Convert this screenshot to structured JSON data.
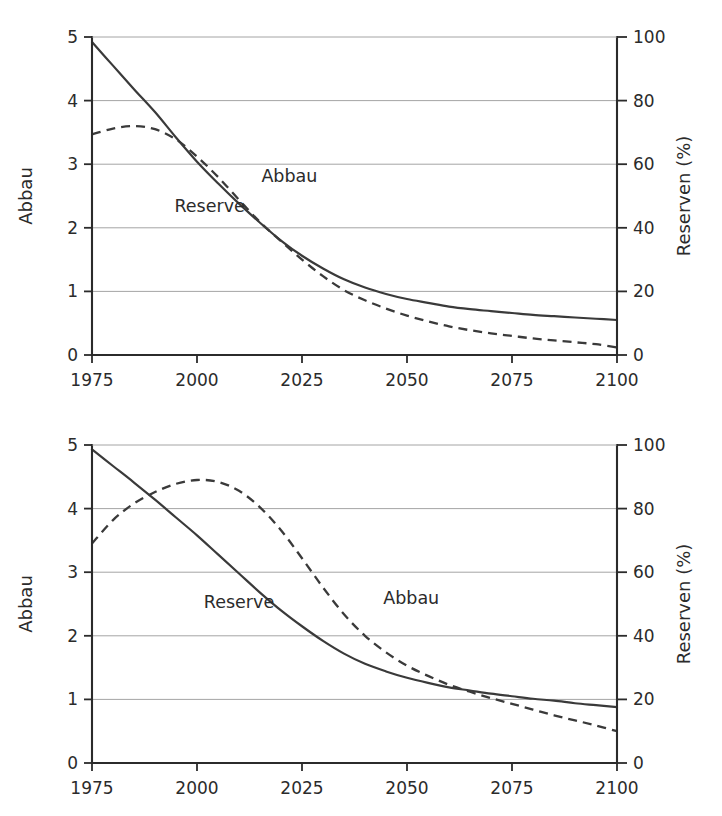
{
  "figure": {
    "background": "#ffffff",
    "ink_color": "#2b2b2b",
    "grid_color": "#9a9a9a"
  },
  "chart_data": [
    {
      "type": "line",
      "panel": "top",
      "title": "",
      "subtitle": "",
      "xlabel": "",
      "ylabel": "Abbau",
      "y2label": "Reserven (%)",
      "xlim": [
        1975,
        2100
      ],
      "ylim": [
        0,
        5
      ],
      "y2lim": [
        0,
        100
      ],
      "grid": true,
      "grid_axis": "y",
      "legend": "inline-annotations",
      "xticks": [
        1975,
        2000,
        2025,
        2050,
        2075,
        2100
      ],
      "xticklabels": [
        "1975",
        "2000",
        "2025",
        "2050",
        "2075",
        "2100"
      ],
      "yticks": [
        0,
        1,
        2,
        3,
        4,
        5
      ],
      "yticklabels": [
        "0",
        "1",
        "2",
        "3",
        "4",
        "5"
      ],
      "y2ticks": [
        0,
        20,
        40,
        60,
        80,
        100
      ],
      "y2ticklabels": [
        "0",
        "20",
        "40",
        "60",
        "80",
        "100"
      ],
      "annotations": [
        {
          "text": "Reserve",
          "x": 2003,
          "y": 2.25
        },
        {
          "text": "Abbau",
          "x": 2022,
          "y": 2.72
        }
      ],
      "x": [
        1975,
        1980,
        1985,
        1990,
        1995,
        2000,
        2005,
        2010,
        2015,
        2020,
        2025,
        2030,
        2035,
        2040,
        2045,
        2050,
        2055,
        2060,
        2065,
        2070,
        2075,
        2080,
        2085,
        2090,
        2095,
        2100
      ],
      "series": [
        {
          "name": "Reserve",
          "style": "solid",
          "axis": "left",
          "units": "Abbau / Reserven (%)",
          "values": [
            4.92,
            4.55,
            4.18,
            3.82,
            3.42,
            3.04,
            2.7,
            2.38,
            2.08,
            1.8,
            1.56,
            1.36,
            1.19,
            1.06,
            0.96,
            0.88,
            0.82,
            0.76,
            0.72,
            0.69,
            0.66,
            0.63,
            0.61,
            0.59,
            0.57,
            0.55
          ],
          "values_percent": [
            98.4,
            91.0,
            83.6,
            76.4,
            68.4,
            60.8,
            54.0,
            47.6,
            41.6,
            36.0,
            31.2,
            27.2,
            23.8,
            21.2,
            19.2,
            17.6,
            16.4,
            15.2,
            14.4,
            13.8,
            13.2,
            12.6,
            12.2,
            11.8,
            11.4,
            11.0
          ]
        },
        {
          "name": "Abbau",
          "style": "dashed",
          "axis": "left",
          "units": "Abbau / Reserven (%)",
          "values": [
            3.47,
            3.56,
            3.6,
            3.55,
            3.39,
            3.12,
            2.8,
            2.44,
            2.09,
            1.79,
            1.5,
            1.24,
            1.02,
            0.86,
            0.73,
            0.62,
            0.53,
            0.45,
            0.39,
            0.34,
            0.3,
            0.26,
            0.23,
            0.2,
            0.17,
            0.12
          ],
          "values_percent": [
            69.4,
            71.2,
            72.0,
            71.0,
            67.8,
            62.4,
            56.0,
            48.8,
            41.8,
            35.8,
            30.0,
            24.8,
            20.4,
            17.2,
            14.6,
            12.4,
            10.6,
            9.0,
            7.8,
            6.8,
            6.0,
            5.2,
            4.6,
            4.0,
            3.4,
            2.4
          ]
        }
      ]
    },
    {
      "type": "line",
      "panel": "bottom",
      "title": "",
      "subtitle": "",
      "xlabel": "",
      "ylabel": "Abbau",
      "y2label": "Reserven (%)",
      "xlim": [
        1975,
        2100
      ],
      "ylim": [
        0,
        5
      ],
      "y2lim": [
        0,
        100
      ],
      "grid": true,
      "grid_axis": "y",
      "legend": "inline-annotations",
      "xticks": [
        1975,
        2000,
        2025,
        2050,
        2075,
        2100
      ],
      "xticklabels": [
        "1975",
        "2000",
        "2025",
        "2050",
        "2075",
        "2100"
      ],
      "yticks": [
        0,
        1,
        2,
        3,
        4,
        5
      ],
      "yticklabels": [
        "0",
        "1",
        "2",
        "3",
        "4",
        "5"
      ],
      "y2ticks": [
        0,
        20,
        40,
        60,
        80,
        100
      ],
      "y2ticklabels": [
        "0",
        "20",
        "40",
        "60",
        "80",
        "100"
      ],
      "annotations": [
        {
          "text": "Reserve",
          "x": 2010,
          "y": 2.44
        },
        {
          "text": "Abbau",
          "x": 2051,
          "y": 2.5
        }
      ],
      "x": [
        1975,
        1980,
        1985,
        1990,
        1995,
        2000,
        2005,
        2010,
        2015,
        2020,
        2025,
        2030,
        2035,
        2040,
        2045,
        2050,
        2055,
        2060,
        2065,
        2070,
        2075,
        2080,
        2085,
        2090,
        2095,
        2100
      ],
      "series": [
        {
          "name": "Reserve",
          "style": "solid",
          "axis": "left",
          "units": "Abbau / Reserven (%)",
          "values": [
            4.93,
            4.67,
            4.41,
            4.14,
            3.86,
            3.58,
            3.28,
            2.98,
            2.68,
            2.4,
            2.15,
            1.92,
            1.72,
            1.56,
            1.44,
            1.34,
            1.26,
            1.19,
            1.14,
            1.09,
            1.05,
            1.01,
            0.98,
            0.94,
            0.91,
            0.88
          ],
          "values_percent": [
            98.6,
            93.4,
            88.2,
            82.8,
            77.2,
            71.6,
            65.6,
            59.6,
            53.6,
            48.0,
            43.0,
            38.4,
            34.4,
            31.2,
            28.8,
            26.8,
            25.2,
            23.8,
            22.8,
            21.8,
            21.0,
            20.2,
            19.6,
            18.8,
            18.2,
            17.6
          ]
        },
        {
          "name": "Abbau",
          "style": "dashed",
          "axis": "left",
          "units": "Abbau / Reserven (%)",
          "values": [
            3.45,
            3.82,
            4.08,
            4.26,
            4.39,
            4.45,
            4.42,
            4.28,
            4.02,
            3.66,
            3.22,
            2.76,
            2.34,
            2.0,
            1.74,
            1.53,
            1.37,
            1.23,
            1.12,
            1.02,
            0.93,
            0.84,
            0.75,
            0.67,
            0.59,
            0.5
          ],
          "values_percent": [
            69.0,
            76.4,
            81.6,
            85.2,
            87.8,
            89.0,
            88.4,
            85.6,
            80.4,
            73.2,
            64.4,
            55.2,
            46.8,
            40.0,
            34.8,
            30.6,
            27.4,
            24.6,
            22.4,
            20.4,
            18.6,
            16.8,
            15.0,
            13.4,
            11.8,
            10.0
          ]
        }
      ]
    }
  ]
}
